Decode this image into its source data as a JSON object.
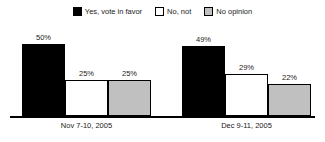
{
  "chart_data": {
    "type": "bar",
    "title": "",
    "xlabel": "",
    "ylabel": "",
    "ylim": [
      0,
      60
    ],
    "grid": false,
    "legend_position": "top-center",
    "value_suffix": "%",
    "categories": [
      "Nov 7-10, 2005",
      "Dec 9-11, 2005"
    ],
    "series": [
      {
        "name": "Yes, vote in favor",
        "color": "#000000",
        "swatch": "sw-black",
        "fill": "fill-black",
        "values": [
          50,
          49
        ],
        "labels": [
          "50%",
          "49%"
        ]
      },
      {
        "name": "No, not",
        "color": "#ffffff",
        "swatch": "sw-white",
        "fill": "fill-white",
        "values": [
          25,
          29
        ],
        "labels": [
          "25%",
          "29%"
        ]
      },
      {
        "name": "No opinion",
        "color": "#c0c0c0",
        "swatch": "sw-gray",
        "fill": "fill-gray",
        "values": [
          25,
          22
        ],
        "labels": [
          "25%",
          "22%"
        ]
      }
    ]
  },
  "legend": {
    "items": [
      {
        "label": "Yes, vote in favor"
      },
      {
        "label": "No, not"
      },
      {
        "label": "No opinion"
      }
    ]
  },
  "axis": {
    "category_labels": [
      "Nov 7-10, 2005",
      "Dec 9-11, 2005"
    ]
  },
  "colors": {
    "yes": "#000000",
    "no": "#ffffff",
    "no_opinion": "#c0c0c0",
    "axis": "#000000",
    "text": "#1a1a1a",
    "background": "#ffffff"
  }
}
